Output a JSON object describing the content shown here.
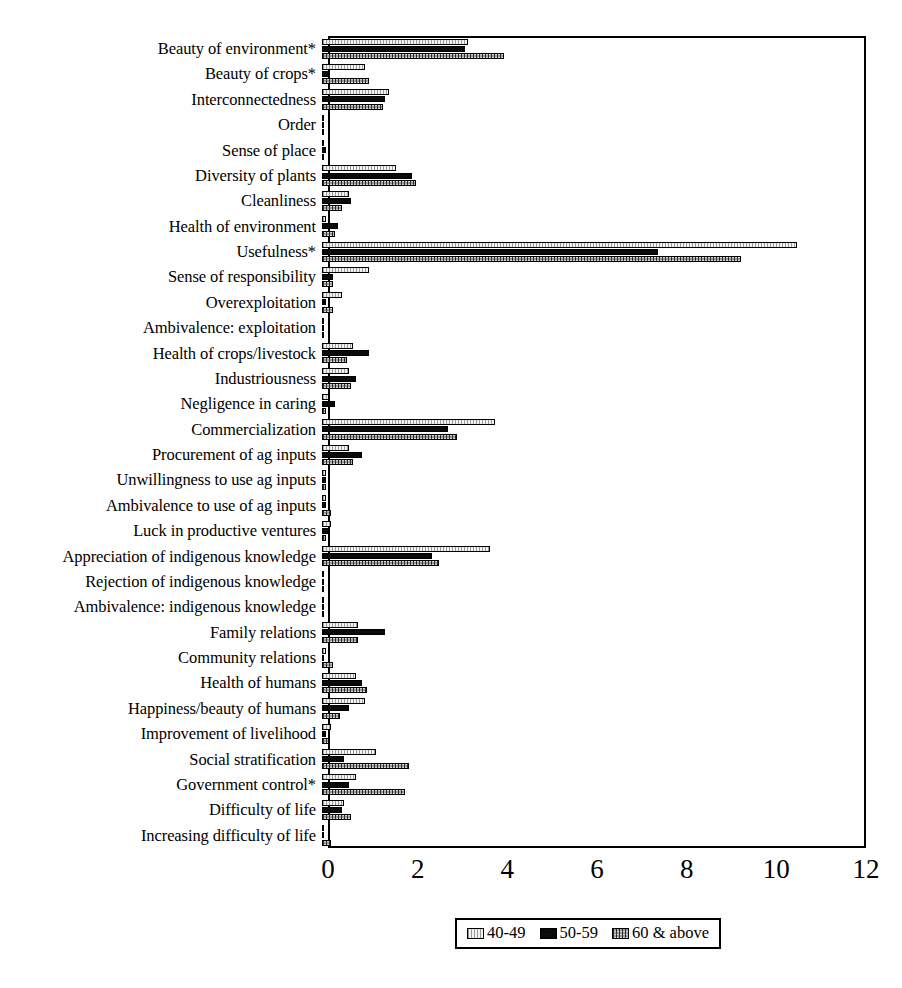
{
  "chart_data": {
    "type": "bar",
    "orientation": "horizontal",
    "title": "",
    "subtitle": "",
    "xlabel": "",
    "ylabel": "",
    "xlim": [
      0,
      12
    ],
    "xticks": [
      0,
      2,
      4,
      6,
      8,
      10,
      12
    ],
    "grid": false,
    "legend_position": "bottom",
    "categories": [
      "Beauty of environment*",
      "Beauty of crops*",
      "Interconnectedness",
      "Order",
      "Sense of place",
      "Diversity of plants",
      "Cleanliness",
      "Health of environment",
      "Usefulness*",
      "Sense of responsibility",
      "Overexploitation",
      "Ambivalence: exploitation",
      "Health of crops/livestock",
      "Industriousness",
      "Negligence in caring",
      "Commercialization",
      "Procurement of ag inputs",
      "Unwillingness to use ag inputs",
      "Ambivalence to use of ag inputs",
      "Luck in productive ventures",
      "Appreciation of indigenous knowledge",
      "Rejection of indigenous knowledge",
      "Ambivalence: indigenous knowledge",
      "Family relations",
      "Community relations",
      "Health of humans",
      "Happiness/beauty of humans",
      "Improvement of livelihood",
      "Social stratification",
      "Government control*",
      "Difficulty of life",
      "Increasing difficulty of life"
    ],
    "series": [
      {
        "name": "40-49",
        "pattern": "light-dotted",
        "values": [
          3.25,
          0.95,
          1.5,
          0.0,
          0.05,
          1.65,
          0.6,
          0.1,
          10.6,
          1.05,
          0.45,
          0.0,
          0.7,
          0.6,
          0.15,
          3.85,
          0.6,
          0.1,
          0.1,
          0.2,
          3.75,
          0.05,
          0.05,
          0.8,
          0.1,
          0.75,
          0.95,
          0.2,
          1.2,
          0.75,
          0.5,
          0.05
        ]
      },
      {
        "name": "50-59",
        "pattern": "solid-black",
        "values": [
          3.2,
          0.15,
          1.4,
          0.0,
          0.1,
          2.0,
          0.65,
          0.35,
          7.5,
          0.25,
          0.1,
          0.0,
          1.05,
          0.75,
          0.3,
          2.8,
          0.9,
          0.1,
          0.1,
          0.15,
          2.45,
          0.05,
          0.05,
          1.4,
          0.05,
          0.9,
          0.6,
          0.1,
          0.5,
          0.6,
          0.45,
          0.05
        ]
      },
      {
        "name": "60 & above",
        "pattern": "medium-dotted",
        "values": [
          4.05,
          1.05,
          1.35,
          0.0,
          0.05,
          2.1,
          0.45,
          0.3,
          9.35,
          0.25,
          0.25,
          0.0,
          0.55,
          0.65,
          0.1,
          3.0,
          0.7,
          0.1,
          0.2,
          0.1,
          2.6,
          0.0,
          0.0,
          0.8,
          0.25,
          1.0,
          0.4,
          0.15,
          1.95,
          1.85,
          0.65,
          0.2
        ]
      }
    ]
  },
  "legend": {
    "items": [
      {
        "label": "40-49"
      },
      {
        "label": "50-59"
      },
      {
        "label": "60 & above"
      }
    ]
  },
  "axis": {
    "x_tick_labels": [
      "0",
      "2",
      "4",
      "6",
      "8",
      "10",
      "12"
    ]
  },
  "colors": {
    "series_40_49": "#f2f2f2",
    "series_50_59": "#0a0a0a",
    "series_60_above": "#9d9d9d",
    "axis": "#000000",
    "background": "#ffffff"
  }
}
